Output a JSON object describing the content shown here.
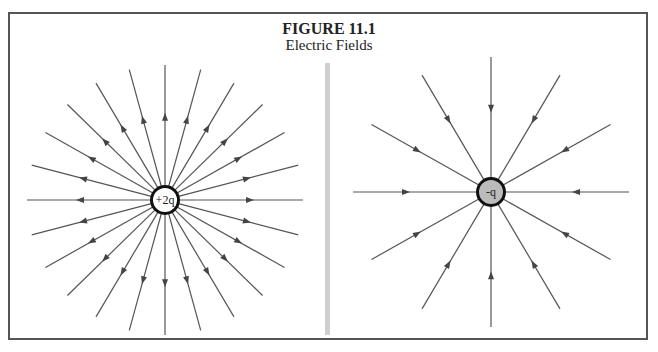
{
  "figure": {
    "title": "FIGURE 11.1",
    "subtitle": "Electric Fields"
  },
  "left_panel": {
    "charge_label": "+2q",
    "line_count": 24,
    "arrow_direction": "outward",
    "charge_fill": "#ffffff"
  },
  "right_panel": {
    "charge_label": "-q",
    "line_count": 12,
    "arrow_direction": "inward",
    "charge_fill": "#bbbbbb"
  },
  "colors": {
    "line": "#555555",
    "charge_border": "#111111",
    "frame": "#555555",
    "divider": "#cfcfcf"
  }
}
